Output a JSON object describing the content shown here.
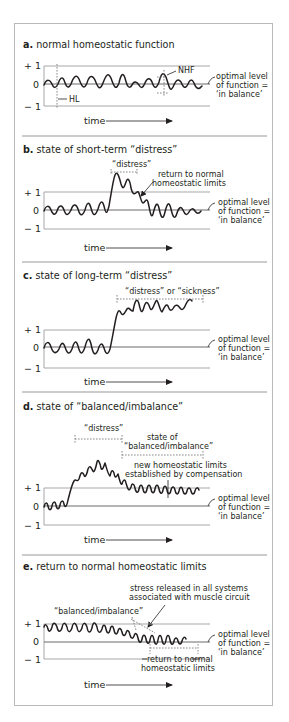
{
  "colors": {
    "ink": "#231f20",
    "frame": "#b9b9b9",
    "axis": "#9d9d9d",
    "separator": "#8c8c8c"
  },
  "axis_ticks": {
    "plus_one": "+ 1",
    "zero": "0",
    "minus_one": "− 1"
  },
  "time_label": "time",
  "optimal_label": {
    "line1": "optimal level",
    "line2": "of function =",
    "line3": "‘in balance’"
  },
  "panels": [
    {
      "letter": "a.",
      "title": "normal homeostatic function",
      "annotations": {
        "hl": "HL",
        "nhf": "NHF"
      }
    },
    {
      "letter": "b.",
      "title": "state of short-term “distress”",
      "annotations": {
        "distress": "“distress”",
        "return1": "return to normal",
        "return2": "homeostatic limits"
      }
    },
    {
      "letter": "c.",
      "title": "state of long-term “distress”",
      "annotations": {
        "distress_sickness": "“distress” or “sickness”"
      }
    },
    {
      "letter": "d.",
      "title": "state of “balanced/imbalance”",
      "annotations": {
        "distress": "“distress”",
        "state1": "state of",
        "state2": "“balanced/imbalance”",
        "new1": "new homeostatic limits",
        "new2": "established by compensation"
      }
    },
    {
      "letter": "e.",
      "title": "return to normal homeostatic limits",
      "annotations": {
        "stress1": "stress released in all systems",
        "stress2": "associated with muscle circuit",
        "balanced": "“balanced/imbalance”",
        "return1": "return to normal",
        "return2": "homeostatic limits"
      }
    }
  ]
}
